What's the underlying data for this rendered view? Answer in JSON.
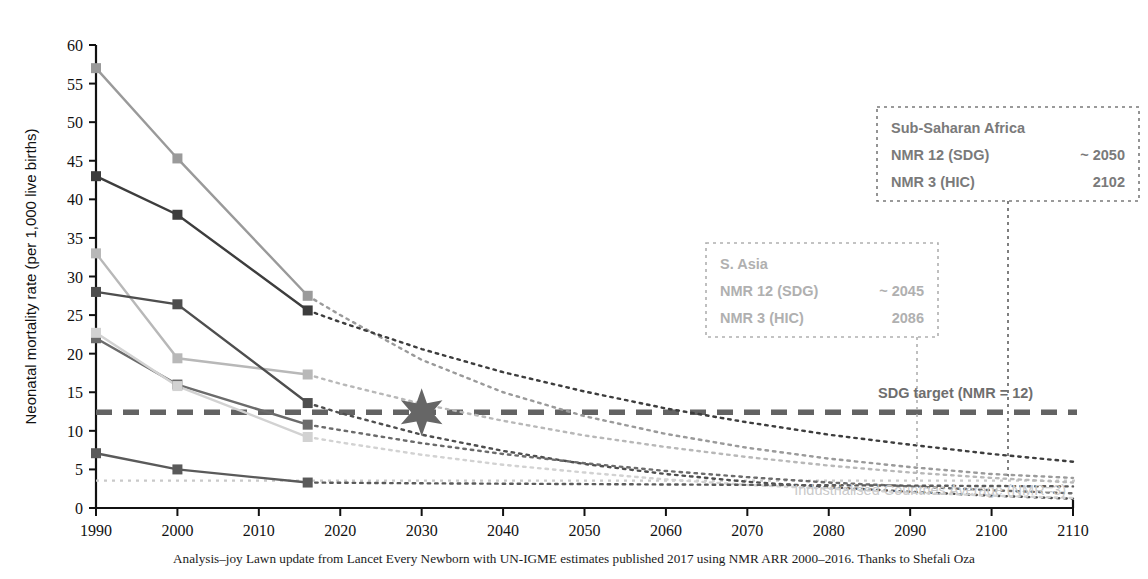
{
  "chart_data": {
    "type": "line",
    "title": "",
    "xlabel": "",
    "ylabel": "Neonatal mortality rate (per 1,000 live births)",
    "xlim": [
      1990,
      2110
    ],
    "ylim": [
      0,
      60
    ],
    "xticks": [
      1990,
      2000,
      2010,
      2020,
      2030,
      2040,
      2050,
      2060,
      2070,
      2080,
      2090,
      2100,
      2110
    ],
    "yticks": [
      0,
      5,
      10,
      15,
      20,
      25,
      30,
      35,
      40,
      45,
      50,
      55,
      60
    ],
    "grid": false,
    "legend": "none",
    "observed_x": [
      1990,
      2000,
      2016
    ],
    "series": [
      {
        "name": "Sub-Saharan Africa",
        "color": "#9a9a9a",
        "values": [
          57.0,
          45.3,
          27.5
        ],
        "projection": {
          "x": [
            2016,
            2020,
            2030,
            2040,
            2050,
            2060,
            2070,
            2080,
            2090,
            2100,
            2102,
            2110
          ],
          "y": [
            27.5,
            25.0,
            19.2,
            15.0,
            11.9,
            9.6,
            7.8,
            6.4,
            5.3,
            4.4,
            4.3,
            3.9
          ]
        }
      },
      {
        "name": "Central & Southern Asia",
        "color": "#3d3d3d",
        "values": [
          43.0,
          38.0,
          25.6
        ],
        "projection": {
          "x": [
            2016,
            2020,
            2030,
            2040,
            2050,
            2060,
            2070,
            2080,
            2090,
            2100,
            2110
          ],
          "y": [
            25.6,
            24.1,
            20.6,
            17.6,
            15.1,
            12.9,
            11.1,
            9.5,
            8.2,
            7.0,
            6.0
          ]
        }
      },
      {
        "name": "Oceania",
        "color": "#b8b8b8",
        "values": [
          33.0,
          19.4,
          17.3
        ],
        "projection": {
          "x": [
            2016,
            2020,
            2030,
            2040,
            2050,
            2060,
            2070,
            2080,
            2090,
            2100,
            2110
          ],
          "y": [
            17.3,
            16.1,
            13.5,
            11.3,
            9.4,
            7.9,
            6.6,
            5.5,
            4.6,
            3.9,
            3.3
          ]
        }
      },
      {
        "name": "Eastern & South-Eastern Asia",
        "color": "#4e4e4e",
        "values": [
          28.0,
          26.4,
          13.6
        ],
        "projection": {
          "x": [
            2016,
            2020,
            2030,
            2040,
            2050,
            2060,
            2070,
            2080,
            2090,
            2100,
            2110
          ],
          "y": [
            13.6,
            12.3,
            9.5,
            7.4,
            5.7,
            4.4,
            3.4,
            2.7,
            2.1,
            1.6,
            1.2
          ]
        }
      },
      {
        "name": "Latin America & Caribbean",
        "color": "#6b6b6b",
        "values": [
          22.0,
          16.0,
          10.8
        ],
        "projection": {
          "x": [
            2016,
            2020,
            2030,
            2040,
            2050,
            2060,
            2070,
            2080,
            2090,
            2100,
            2110
          ],
          "y": [
            10.8,
            10.1,
            8.4,
            7.0,
            5.8,
            4.8,
            4.0,
            3.3,
            2.8,
            2.3,
            1.9
          ]
        }
      },
      {
        "name": "Northern Africa & Western Asia",
        "color": "#d2d2d2",
        "values": [
          22.7,
          15.8,
          9.2
        ],
        "projection": {
          "x": [
            2016,
            2020,
            2030,
            2040,
            2050,
            2060,
            2070,
            2080,
            2090,
            2100,
            2110
          ],
          "y": [
            9.2,
            8.5,
            6.9,
            5.6,
            4.6,
            3.7,
            3.0,
            2.5,
            2.0,
            1.6,
            1.3
          ]
        }
      },
      {
        "name": "Europe & Northern America",
        "color": "#5a5a5a",
        "values": [
          7.1,
          5.0,
          3.3
        ],
        "projection": {
          "x": [
            2016,
            2030,
            2050,
            2070,
            2090,
            2110
          ],
          "y": [
            3.3,
            3.2,
            3.1,
            3.0,
            2.9,
            2.8
          ]
        }
      }
    ],
    "reference_lines": [
      {
        "name": "sdg-target",
        "label": "SDG target (NMR = 12)",
        "value": 12.4,
        "style": "dashed",
        "color": "#636363"
      },
      {
        "name": "industrialised-average",
        "label": "Industrialised Countries Average (NMR=3)",
        "value": 3.55,
        "style": "dotted",
        "color": "#c9c9c9"
      }
    ],
    "markers": [
      {
        "name": "sdg-2030-star",
        "shape": "6-point-star",
        "x": 2030,
        "y": 12.4,
        "color": "#666666"
      }
    ]
  },
  "annotations": {
    "ssa": {
      "name": "Sub-Saharan Africa",
      "title": "Sub-Saharan Africa",
      "rows": [
        {
          "label": "NMR 12 (SDG)",
          "value": "~ 2050"
        },
        {
          "label": "NMR 3 (HIC)",
          "value": "2102"
        }
      ],
      "color": "#7a7a7a",
      "connector_year": 2102
    },
    "sasia": {
      "name": "S. Asia",
      "title": "S. Asia",
      "rows": [
        {
          "label": "NMR 12 (SDG)",
          "value": "~ 2045"
        },
        {
          "label": "NMR 3 (HIC)",
          "value": "2086"
        }
      ],
      "color": "#b0b0b0",
      "connector_year": 2086
    }
  },
  "labels": {
    "sdg_target": "SDG target (NMR = 12)",
    "industrialised": "Industrialised Countries Average (NMR=3)",
    "y_axis": "Neonatal mortality rate (per 1,000 live births)"
  },
  "caption": "Analysis–joy Lawn update from Lancet Every Newborn with UN-IGME estimates published 2017 using NMR ARR 2000–2016. Thanks to Shefali Oza"
}
